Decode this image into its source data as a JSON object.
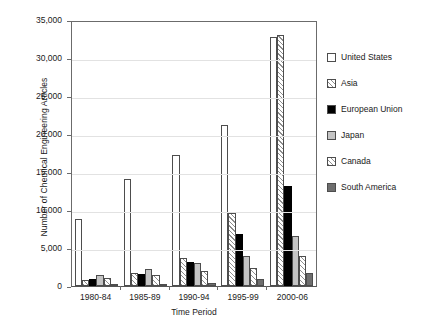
{
  "chart_data": {
    "type": "bar",
    "title": "",
    "xlabel": "Time Period",
    "ylabel": "Number of Chemical Engineering Articles",
    "categories": [
      "1980-84",
      "1985-89",
      "1990-94",
      "1995-99",
      "2000-06"
    ],
    "ylim": [
      0,
      35000
    ],
    "yticks": [
      "0",
      "5,000",
      "10,000",
      "15,000",
      "20,000",
      "25,000",
      "30,000",
      "35,000"
    ],
    "ytick_values": [
      0,
      5000,
      10000,
      15000,
      20000,
      25000,
      30000,
      35000
    ],
    "grid": true,
    "legend_position": "right",
    "series": [
      {
        "name": "United States",
        "pattern": "white",
        "values": [
          8800,
          14100,
          17200,
          21200,
          32700
        ]
      },
      {
        "name": "Asia",
        "pattern": "hatch",
        "values": [
          800,
          1700,
          3700,
          9600,
          33000
        ]
      },
      {
        "name": "European Union",
        "pattern": "black",
        "values": [
          900,
          1600,
          3200,
          6800,
          13200
        ]
      },
      {
        "name": "Japan",
        "pattern": "lightgray",
        "values": [
          1500,
          2200,
          3000,
          4000,
          6600
        ]
      },
      {
        "name": "Canada",
        "pattern": "cross",
        "values": [
          1100,
          1500,
          2000,
          2400,
          3900
        ]
      },
      {
        "name": "South America",
        "pattern": "darkgray",
        "values": [
          100,
          150,
          400,
          900,
          1700
        ]
      }
    ]
  },
  "legend": {
    "items": [
      {
        "label": "United States",
        "pattern": "white"
      },
      {
        "label": "Asia",
        "pattern": "hatch"
      },
      {
        "label": "European Union",
        "pattern": "black"
      },
      {
        "label": "Japan",
        "pattern": "lightgray"
      },
      {
        "label": "Canada",
        "pattern": "cross"
      },
      {
        "label": "South America",
        "pattern": "darkgray"
      }
    ]
  },
  "colors": {
    "axis": "#6b6b6b",
    "grid": "#e2e2e2",
    "black_series": "#000000",
    "lightgray_series": "#c4c4c4",
    "darkgray_series": "#6e6e6e",
    "background": "#ffffff"
  }
}
